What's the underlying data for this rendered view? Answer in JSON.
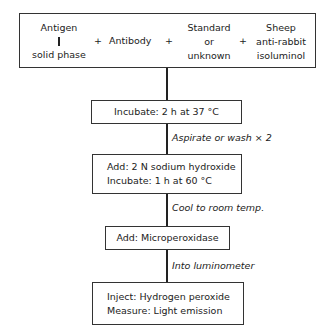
{
  "reagents": {
    "antigen": {
      "top": "Antigen",
      "bottom": "solid phase"
    },
    "plus1": "+",
    "antibody": "Antibody",
    "plus2": "+",
    "standard": [
      "Standard",
      "or",
      "unknown"
    ],
    "plus3": "+",
    "sheep": [
      "Sheep",
      "anti-rabbit",
      "isoluminol"
    ]
  },
  "steps": [
    {
      "lines": [
        "Incubate: 2 h at 37 °C"
      ]
    },
    {
      "lines": [
        "Add: 2 N sodium hydroxide",
        "Incubate: 1 h at 60 °C"
      ]
    },
    {
      "lines": [
        "Add: Microperoxidase"
      ]
    },
    {
      "lines": [
        "Inject: Hydrogen peroxide",
        "Measure: Light emission"
      ]
    }
  ],
  "transitions": [
    "Aspirate or wash × 2",
    "Cool to room temp.",
    "Into luminometer"
  ]
}
